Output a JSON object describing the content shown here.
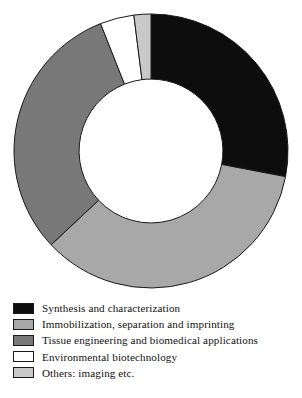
{
  "chart_data": {
    "type": "pie",
    "variant": "donut",
    "title": "",
    "subtitle": "",
    "xlabel": "",
    "ylabel": "",
    "grid": false,
    "legend_position": "bottom-left",
    "start_angle_deg": 0,
    "direction": "clockwise",
    "inner_radius_ratio": 0.525,
    "categories": [
      "Synthesis and characterization",
      "Immobilization, separation and imprinting",
      "Tissue engineering and biomedical applications",
      "Environmental biotechnology",
      "Others: imaging etc."
    ],
    "values": [
      28,
      35,
      31,
      4,
      2
    ],
    "units": "percent",
    "colors": [
      "#0d0d0d",
      "#a8a8a8",
      "#787878",
      "#ffffff",
      "#c9c9c9"
    ],
    "slices": [
      {
        "label": "Synthesis and characterization",
        "value": 28,
        "color": "#0d0d0d",
        "start_deg": 0,
        "end_deg": 100.8
      },
      {
        "label": "Immobilization, separation and imprinting",
        "value": 35,
        "color": "#a8a8a8",
        "start_deg": 100.8,
        "end_deg": 226.8
      },
      {
        "label": "Tissue engineering and biomedical applications",
        "value": 31,
        "color": "#787878",
        "start_deg": 226.8,
        "end_deg": 338.4
      },
      {
        "label": "Environmental biotechnology",
        "value": 4,
        "color": "#ffffff",
        "start_deg": 338.4,
        "end_deg": 352.8
      },
      {
        "label": "Others: imaging etc.",
        "value": 2,
        "color": "#c9c9c9",
        "start_deg": 352.8,
        "end_deg": 360
      }
    ]
  },
  "legend": {
    "items": [
      {
        "label": "Synthesis and characterization",
        "color": "#0d0d0d"
      },
      {
        "label": "Immobilization, separation and imprinting",
        "color": "#a8a8a8"
      },
      {
        "label": "Tissue engineering and biomedical applications",
        "color": "#787878"
      },
      {
        "label": "Environmental biotechnology",
        "color": "#ffffff"
      },
      {
        "label": "Others: imaging etc.",
        "color": "#c9c9c9"
      }
    ]
  },
  "style": {
    "stroke": "#1a1a1a",
    "background": "#ffffff"
  }
}
